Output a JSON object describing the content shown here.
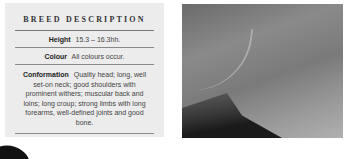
{
  "breed_description": {
    "title": "BREED DESCRIPTION",
    "height": {
      "label": "Height",
      "value": "15.3 – 16.3hh."
    },
    "colour": {
      "label": "Colour",
      "value": "All colours occur."
    },
    "conformation": {
      "label": "Conformation",
      "value": "Quality head; long, well set-on neck; good shoulders with prominent withers; muscular back and loins; long croup; strong limbs with long forearms, well-defined joints and good bone."
    }
  },
  "photo": {
    "subject": "horse-neck-closeup-grayscale"
  },
  "colors": {
    "panel_bg": "#ececec",
    "rule": "#888888",
    "text": "#444444"
  }
}
